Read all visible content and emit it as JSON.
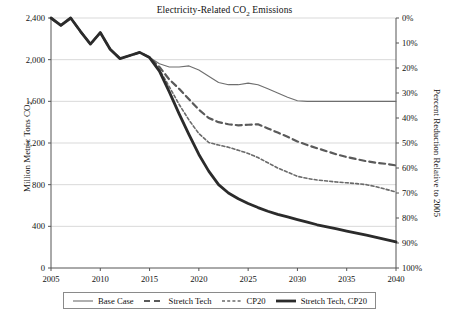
{
  "chart_data": {
    "type": "line",
    "title": "Electricity-Related CO2 Emissions",
    "title_parts": {
      "before": "Electricity-Related CO",
      "sub": "2",
      "after": " Emissions"
    },
    "xlabel": "",
    "ylabel": "Million Metric Tons CO2",
    "ylabel_parts": {
      "before": "Million Metric Tons CO",
      "sub": "2",
      "after": ""
    },
    "ylabel_right": "Percent Reduction Relative to 2005",
    "xlim": [
      2005,
      2040
    ],
    "ylim": [
      0,
      2400
    ],
    "ylim_right": [
      0,
      100
    ],
    "xticks": [
      2005,
      2010,
      2015,
      2020,
      2025,
      2030,
      2035,
      2040
    ],
    "xtick_labels": [
      "2005",
      "2010",
      "2015",
      "2020",
      "2025",
      "2030",
      "2035",
      "2040"
    ],
    "yticks": [
      0,
      400,
      800,
      1200,
      1600,
      2000,
      2400
    ],
    "ytick_labels": [
      "0",
      "400",
      "800",
      "1,200",
      "1,600",
      "2,000",
      "2,400"
    ],
    "yticks_right": [
      0,
      10,
      20,
      30,
      40,
      50,
      60,
      70,
      80,
      90,
      100
    ],
    "ytick_labels_right": [
      "0%",
      "10%",
      "20%",
      "30%",
      "40%",
      "50%",
      "60%",
      "70%",
      "80%",
      "90%",
      "100%"
    ],
    "grid": true,
    "grid_color": "#c9c9c9",
    "legend_position": "below",
    "x": [
      2005,
      2006,
      2007,
      2008,
      2009,
      2010,
      2011,
      2012,
      2013,
      2014,
      2015,
      2016,
      2017,
      2018,
      2019,
      2020,
      2021,
      2022,
      2023,
      2024,
      2025,
      2026,
      2027,
      2028,
      2029,
      2030,
      2031,
      2032,
      2033,
      2034,
      2035,
      2036,
      2037,
      2038,
      2039,
      2040
    ],
    "series": [
      {
        "name": "Base Case",
        "color": "#6e6e6e",
        "style": "solid-thin",
        "width": 1.1,
        "values": [
          2400,
          2330,
          2400,
          2270,
          2150,
          2260,
          2100,
          2010,
          2040,
          2070,
          2020,
          1960,
          1930,
          1930,
          1940,
          1900,
          1840,
          1780,
          1760,
          1760,
          1775,
          1760,
          1720,
          1680,
          1640,
          1605,
          1600,
          1600,
          1600,
          1600,
          1600,
          1600,
          1600,
          1600,
          1600,
          1600
        ]
      },
      {
        "name": "Stretch Tech",
        "color": "#5a5a5a",
        "style": "dashed-long",
        "width": 2.2,
        "values": [
          2400,
          2330,
          2400,
          2270,
          2150,
          2260,
          2100,
          2010,
          2040,
          2070,
          2020,
          1930,
          1810,
          1720,
          1620,
          1520,
          1440,
          1400,
          1380,
          1370,
          1375,
          1380,
          1340,
          1300,
          1260,
          1215,
          1180,
          1150,
          1120,
          1090,
          1065,
          1045,
          1025,
          1010,
          1000,
          985
        ]
      },
      {
        "name": "CP20",
        "color": "#6a6a6a",
        "style": "dashed-short",
        "width": 1.6,
        "values": [
          2400,
          2330,
          2400,
          2270,
          2150,
          2260,
          2100,
          2010,
          2040,
          2070,
          2020,
          1905,
          1740,
          1570,
          1420,
          1290,
          1205,
          1180,
          1160,
          1130,
          1100,
          1060,
          1010,
          960,
          920,
          880,
          860,
          845,
          835,
          825,
          818,
          810,
          800,
          780,
          755,
          730
        ]
      },
      {
        "name": "Stretch Tech, CP20",
        "color": "#2b2b2b",
        "style": "solid-thick",
        "width": 2.8,
        "values": [
          2400,
          2330,
          2400,
          2270,
          2150,
          2260,
          2100,
          2010,
          2040,
          2070,
          2020,
          1890,
          1690,
          1480,
          1280,
          1090,
          930,
          800,
          720,
          665,
          620,
          580,
          545,
          515,
          490,
          465,
          440,
          415,
          395,
          375,
          355,
          335,
          315,
          295,
          272,
          250
        ]
      }
    ]
  },
  "legend": {
    "items": [
      {
        "label": "Base Case"
      },
      {
        "label": "Stretch Tech"
      },
      {
        "label": "CP20"
      },
      {
        "label": "Stretch Tech, CP20"
      }
    ]
  }
}
